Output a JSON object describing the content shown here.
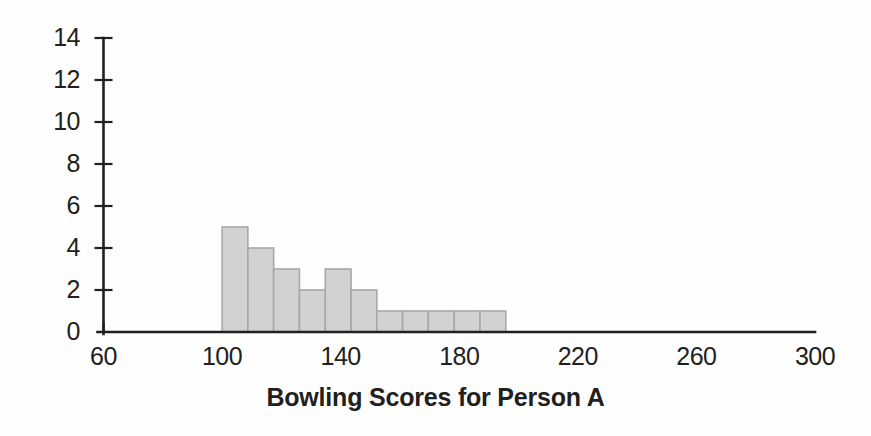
{
  "chart_data": {
    "type": "bar",
    "title": "Bowling Scores for Person A",
    "xlabel": "Bowling Scores for Person A",
    "ylabel": "",
    "xlim": [
      60,
      300
    ],
    "ylim": [
      0,
      14
    ],
    "grid": false,
    "legend": null,
    "bin_width": 8.7,
    "bin_edges": [
      100,
      108.7,
      117.4,
      126.1,
      134.8,
      143.5,
      152.2,
      160.9,
      169.6,
      178.3,
      187.0,
      195.7
    ],
    "categories": [
      "100-109",
      "109-117",
      "117-126",
      "126-135",
      "135-144",
      "144-152",
      "152-161",
      "161-170",
      "170-178",
      "178-187",
      "187-196"
    ],
    "values": [
      5,
      4,
      3,
      2,
      3,
      2,
      1,
      1,
      1,
      1,
      1
    ],
    "x_ticks": [
      60,
      100,
      140,
      180,
      220,
      260,
      300
    ],
    "x_tick_labels": [
      "60",
      "100",
      "140",
      "180",
      "220",
      "260",
      "300"
    ],
    "y_ticks": [
      0,
      2,
      4,
      6,
      8,
      10,
      12,
      14
    ],
    "y_tick_labels": [
      "0",
      "2",
      "4",
      "6",
      "8",
      "10",
      "12",
      "14"
    ],
    "colors": {
      "bar_fill": "#d2d2d2",
      "bar_stroke": "#a8a8a8",
      "axis": "#231f20",
      "text": "#231f20",
      "background": "#fefefe"
    }
  }
}
